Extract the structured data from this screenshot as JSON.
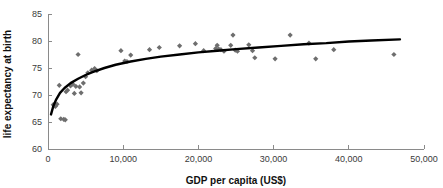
{
  "chart_data": {
    "type": "scatter",
    "title": "",
    "xlabel": "GDP per capita (US$)",
    "ylabel": "life expectancy at birth",
    "xlim": [
      0,
      50000
    ],
    "ylim": [
      60,
      85
    ],
    "xticks": [
      0,
      10000,
      20000,
      30000,
      40000,
      50000
    ],
    "xtick_labels": [
      "0",
      "10,000",
      "20,000",
      "30,000",
      "40,000",
      "50,000"
    ],
    "yticks": [
      60,
      65,
      70,
      75,
      80,
      85
    ],
    "ytick_labels": [
      "60",
      "65",
      "70",
      "75",
      "80",
      "85"
    ],
    "grid": false,
    "legend": "none",
    "series": [
      {
        "name": "countries",
        "marker": "diamond",
        "color": "#6e6e6e",
        "points": [
          [
            700,
            68.2
          ],
          [
            900,
            68.0
          ],
          [
            1000,
            67.9
          ],
          [
            1200,
            68.3
          ],
          [
            1500,
            71.8
          ],
          [
            1700,
            65.6
          ],
          [
            2100,
            65.5
          ],
          [
            2300,
            65.4
          ],
          [
            2400,
            70.6
          ],
          [
            2600,
            70.9
          ],
          [
            3000,
            71.7
          ],
          [
            3300,
            72.0
          ],
          [
            3500,
            70.3
          ],
          [
            3700,
            71.6
          ],
          [
            4000,
            77.5
          ],
          [
            4200,
            71.5
          ],
          [
            4400,
            70.4
          ],
          [
            4700,
            72.2
          ],
          [
            5000,
            73.4
          ],
          [
            5300,
            74.1
          ],
          [
            5800,
            74.6
          ],
          [
            6200,
            74.9
          ],
          [
            6500,
            74.5
          ],
          [
            9700,
            78.2
          ],
          [
            10200,
            76.3
          ],
          [
            10500,
            76.2
          ],
          [
            11000,
            77.4
          ],
          [
            13500,
            78.4
          ],
          [
            14800,
            78.8
          ],
          [
            17500,
            79.1
          ],
          [
            19600,
            79.5
          ],
          [
            20700,
            78.2
          ],
          [
            22300,
            78.6
          ],
          [
            22500,
            79.2
          ],
          [
            22700,
            78.5
          ],
          [
            23000,
            78.4
          ],
          [
            23400,
            78.1
          ],
          [
            24300,
            79.2
          ],
          [
            24600,
            81.1
          ],
          [
            24900,
            78.3
          ],
          [
            25200,
            78.1
          ],
          [
            26700,
            79.3
          ],
          [
            27200,
            78.2
          ],
          [
            27500,
            76.9
          ],
          [
            30200,
            76.7
          ],
          [
            32200,
            81.1
          ],
          [
            34700,
            79.6
          ],
          [
            35600,
            76.7
          ],
          [
            38000,
            78.4
          ],
          [
            46000,
            77.5
          ]
        ]
      }
    ],
    "fit_curve": {
      "name": "logarithmic trend line",
      "color": "#000000",
      "points": [
        [
          400,
          66.4
        ],
        [
          700,
          67.9
        ],
        [
          1100,
          69.2
        ],
        [
          1600,
          70.4
        ],
        [
          2200,
          71.3
        ],
        [
          3000,
          72.2
        ],
        [
          4000,
          73.0
        ],
        [
          5000,
          73.7
        ],
        [
          6000,
          74.3
        ],
        [
          7500,
          75.0
        ],
        [
          9000,
          75.6
        ],
        [
          11000,
          76.2
        ],
        [
          13000,
          76.7
        ],
        [
          15000,
          77.1
        ],
        [
          17500,
          77.5
        ],
        [
          20000,
          77.9
        ],
        [
          22500,
          78.2
        ],
        [
          25000,
          78.5
        ],
        [
          28000,
          78.8
        ],
        [
          31000,
          79.1
        ],
        [
          34000,
          79.4
        ],
        [
          37000,
          79.6
        ],
        [
          40000,
          79.9
        ],
        [
          43000,
          80.1
        ],
        [
          46800,
          80.3
        ]
      ]
    }
  }
}
